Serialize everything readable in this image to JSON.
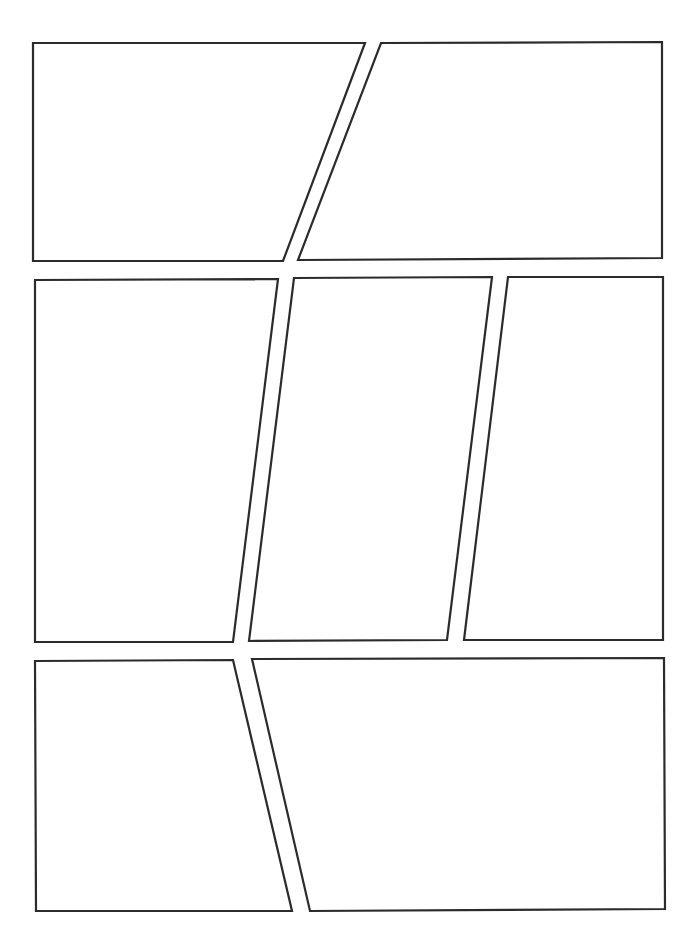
{
  "page": {
    "width": 698,
    "height": 949,
    "background": "#ffffff",
    "border_color": "#2b2b2b",
    "border_width": 2.2
  },
  "rows": [
    {
      "name": "row-1",
      "panels": [
        {
          "id": "panel-1",
          "points": "33,43 365,43 283,261 33,261"
        },
        {
          "id": "panel-2",
          "points": "381,43 662,42 662,258 298,260"
        }
      ]
    },
    {
      "name": "row-2",
      "panels": [
        {
          "id": "panel-3",
          "points": "35,280 278,279 233,642 35,642"
        },
        {
          "id": "panel-4",
          "points": "294,278 492,277 447,640 249,641"
        },
        {
          "id": "panel-5",
          "points": "508,277 663,277 663,640 464,640"
        }
      ]
    },
    {
      "name": "row-3",
      "panels": [
        {
          "id": "panel-6",
          "points": "35,661 233,660 292,911 36,911"
        },
        {
          "id": "panel-7",
          "points": "252,659 664,658 665,909 310,911"
        }
      ]
    }
  ]
}
